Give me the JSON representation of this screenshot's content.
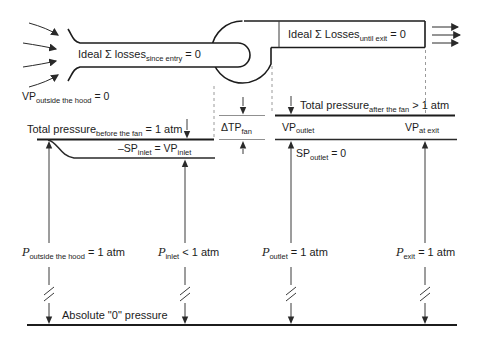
{
  "figure": {
    "colors": {
      "background": "#ffffff",
      "ink": "#1c1c1c",
      "gray_line": "#909090",
      "dashed_line": "#9a9a9a"
    }
  },
  "labels": {
    "losses_entry": {
      "main": "Ideal Σ losses",
      "sub": "since entry",
      "tail": " = 0"
    },
    "losses_exit": {
      "main": "Ideal Σ Losses",
      "sub": "until exit",
      "tail": " = 0"
    },
    "vp_outside": {
      "main": "VP",
      "sub": "outside the hood",
      "tail": " = 0"
    },
    "tp_before": {
      "main": "Total pressure",
      "sub": "before the fan",
      "tail": " = 1 atm"
    },
    "sp_inlet": {
      "p1": "–SP",
      "s1": "inlet",
      "p2": " = VP",
      "s2": "inlet"
    },
    "dtp_fan": {
      "main": "ΔTP",
      "sub": "fan"
    },
    "tp_after": {
      "main": "Total pressure",
      "sub": "after the fan",
      "tail": " > 1 atm"
    },
    "vp_outlet": {
      "main": "VP",
      "sub": "outlet"
    },
    "vp_at_exit": {
      "main": "VP",
      "sub": "at exit"
    },
    "sp_outlet": {
      "main": "SP",
      "sub": "outlet",
      "tail": " = 0"
    },
    "p_hood": {
      "main": "P",
      "sub": "outside the hood",
      "tail": " = 1 atm"
    },
    "p_inlet": {
      "main": "P",
      "sub": "inlet",
      "tail": " < 1 atm"
    },
    "p_outlet": {
      "main": "P",
      "sub": "outlet",
      "tail": " = 1 atm"
    },
    "p_exit": {
      "main": "P",
      "sub": "exit",
      "tail": " = 1 atm"
    },
    "abs_zero": "Absolute \"0\" pressure"
  }
}
